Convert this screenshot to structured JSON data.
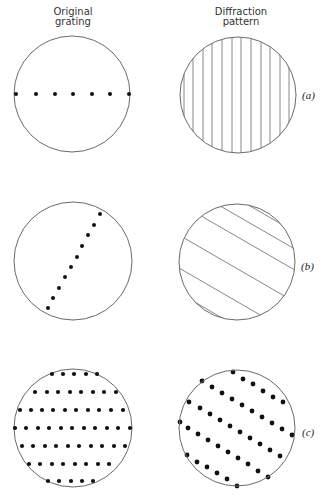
{
  "headers": {
    "left": [
      "Original",
      "grating"
    ],
    "right": [
      "Diffraction",
      "pattern"
    ]
  },
  "colors": {
    "stroke": "#6a6a6a",
    "dot": "#111111",
    "line": "#7a7a7a",
    "background": "#ffffff"
  },
  "rows": [
    {
      "label": "(a)",
      "original": {
        "circle": {
          "cx": 72,
          "cy": 94,
          "r": 58
        },
        "dot_radius": 2,
        "dots": [
          [
            16,
            94
          ],
          [
            36,
            94
          ],
          [
            55,
            94
          ],
          [
            73,
            94
          ],
          [
            92,
            94
          ],
          [
            110,
            94
          ],
          [
            129,
            94
          ]
        ]
      },
      "diffraction": {
        "circle": {
          "cx": 238,
          "cy": 95,
          "r": 58
        },
        "pattern": "vertical-lines",
        "lines": [
          [
            184,
            30,
            184,
            160
          ],
          [
            193,
            30,
            193,
            160
          ],
          [
            203,
            30,
            203,
            160
          ],
          [
            212,
            30,
            212,
            160
          ],
          [
            222,
            30,
            222,
            160
          ],
          [
            232,
            30,
            232,
            160
          ],
          [
            241,
            30,
            241,
            160
          ],
          [
            251,
            30,
            251,
            160
          ],
          [
            261,
            30,
            261,
            160
          ],
          [
            270,
            30,
            270,
            160
          ],
          [
            280,
            30,
            280,
            160
          ],
          [
            289,
            30,
            289,
            160
          ]
        ]
      }
    },
    {
      "label": "(b)",
      "original": {
        "circle": {
          "cx": 73,
          "cy": 261,
          "r": 59
        },
        "dot_radius": 2,
        "dots": [
          [
            100,
            214
          ],
          [
            94,
            225
          ],
          [
            88,
            235
          ],
          [
            82,
            246
          ],
          [
            77,
            257
          ],
          [
            71,
            267
          ],
          [
            65,
            277
          ],
          [
            59,
            288
          ],
          [
            53,
            298
          ],
          [
            48,
            308
          ]
        ]
      },
      "diffraction": {
        "circle": {
          "cx": 237,
          "cy": 262,
          "r": 58
        },
        "pattern": "diagonal-lines",
        "lines": [
          [
            226,
            192,
            300,
            235
          ],
          [
            196,
            192,
            300,
            252
          ],
          [
            170,
            198,
            300,
            273
          ],
          [
            165,
            227,
            300,
            305
          ],
          [
            160,
            257,
            300,
            338
          ],
          [
            160,
            282,
            300,
            363
          ]
        ]
      }
    },
    {
      "label": "(c)",
      "original": {
        "circle": {
          "cx": 73,
          "cy": 428,
          "r": 59
        },
        "dot_radius": 2.1,
        "dots": [
          [
            52,
            374
          ],
          [
            63,
            374
          ],
          [
            74,
            374
          ],
          [
            86,
            374
          ],
          [
            97,
            374
          ],
          [
            35,
            392
          ],
          [
            47,
            392
          ],
          [
            58,
            392
          ],
          [
            70,
            392
          ],
          [
            81,
            392
          ],
          [
            93,
            392
          ],
          [
            104,
            392
          ],
          [
            116,
            392
          ],
          [
            20,
            410
          ],
          [
            31,
            410
          ],
          [
            42,
            410
          ],
          [
            53,
            410
          ],
          [
            65,
            410
          ],
          [
            76,
            410
          ],
          [
            88,
            410
          ],
          [
            99,
            410
          ],
          [
            111,
            410
          ],
          [
            123,
            410
          ],
          [
            15,
            428
          ],
          [
            26,
            428
          ],
          [
            38,
            428
          ],
          [
            49,
            428
          ],
          [
            61,
            428
          ],
          [
            72,
            428
          ],
          [
            84,
            428
          ],
          [
            95,
            428
          ],
          [
            107,
            428
          ],
          [
            118,
            428
          ],
          [
            130,
            428
          ],
          [
            22,
            446
          ],
          [
            33,
            446
          ],
          [
            45,
            446
          ],
          [
            56,
            446
          ],
          [
            68,
            446
          ],
          [
            79,
            446
          ],
          [
            91,
            446
          ],
          [
            102,
            446
          ],
          [
            114,
            446
          ],
          [
            125,
            446
          ],
          [
            29,
            464
          ],
          [
            40,
            464
          ],
          [
            52,
            464
          ],
          [
            63,
            464
          ],
          [
            75,
            464
          ],
          [
            86,
            464
          ],
          [
            98,
            464
          ],
          [
            109,
            464
          ],
          [
            48,
            481
          ],
          [
            59,
            481
          ],
          [
            71,
            481
          ],
          [
            82,
            481
          ],
          [
            93,
            481
          ]
        ]
      },
      "diffraction": {
        "circle": {
          "cx": 237,
          "cy": 428,
          "r": 58
        },
        "pattern": "dot-rows",
        "dot_radius": 2.4,
        "dots": [
          [
            233,
            372
          ],
          [
            243,
            379
          ],
          [
            253,
            384
          ],
          [
            263,
            391
          ],
          [
            273,
            397
          ],
          [
            283,
            402
          ],
          [
            202,
            381
          ],
          [
            212,
            387
          ],
          [
            222,
            393
          ],
          [
            232,
            399
          ],
          [
            242,
            405
          ],
          [
            252,
            411
          ],
          [
            262,
            417
          ],
          [
            272,
            423
          ],
          [
            282,
            429
          ],
          [
            292,
            435
          ],
          [
            189,
            402
          ],
          [
            200,
            408
          ],
          [
            210,
            414
          ],
          [
            220,
            420
          ],
          [
            230,
            426
          ],
          [
            240,
            432
          ],
          [
            250,
            438
          ],
          [
            260,
            444
          ],
          [
            270,
            450
          ],
          [
            280,
            456
          ],
          [
            180,
            422
          ],
          [
            188,
            428
          ],
          [
            198,
            434
          ],
          [
            208,
            440
          ],
          [
            218,
            446
          ],
          [
            228,
            452
          ],
          [
            238,
            458
          ],
          [
            248,
            464
          ],
          [
            258,
            471
          ],
          [
            268,
            477
          ],
          [
            187,
            455
          ],
          [
            197,
            462
          ],
          [
            207,
            467
          ],
          [
            217,
            473
          ],
          [
            227,
            479
          ],
          [
            237,
            486
          ]
        ]
      }
    }
  ],
  "label_positions": [
    {
      "x": 302,
      "y": 89
    },
    {
      "x": 301,
      "y": 260
    },
    {
      "x": 302,
      "y": 426
    }
  ]
}
